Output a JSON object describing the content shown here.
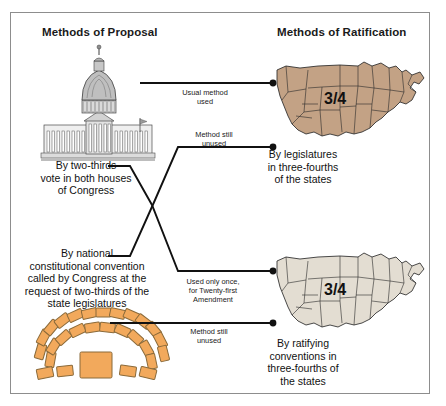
{
  "figure": {
    "titles": {
      "left": "Methods of Proposal",
      "right": "Methods of Ratification"
    },
    "frame_color": "#8d8d8d",
    "background": "#ffffff"
  },
  "proposal_methods": [
    {
      "id": "congress",
      "caption": "By two-thirds\nvote in both houses\nof Congress",
      "illustration": "us-capitol-building-illustration"
    },
    {
      "id": "national-convention",
      "caption": "By national\nconstitutional convention\ncalled by Congress at the\nrequest of two-thirds of the\nstate legislatures",
      "illustration": "convention-desks-arc-illustration"
    }
  ],
  "ratification_methods": [
    {
      "id": "legislatures",
      "caption": "By legislatures\nin three-fourths\nof the states",
      "map_label": "3/4",
      "map_fill": "#c3a285",
      "map_stroke": "#2a2a2a"
    },
    {
      "id": "ratifying-conventions",
      "caption": "By ratifying\nconventions in\nthree-fourths of\nthe states",
      "map_label": "3/4",
      "map_fill": "#e3ddd2",
      "map_stroke": "#2a2a2a"
    }
  ],
  "connections": [
    {
      "id": "usual-method",
      "label": "Usual method\nused",
      "from": "congress",
      "to": "legislatures"
    },
    {
      "id": "unused-top",
      "label": "Method still\nunused",
      "from": "national-convention",
      "to": "legislatures"
    },
    {
      "id": "used-once",
      "label": "Used only once,\nfor Twenty-first\nAmendment",
      "from": "congress",
      "to": "ratifying-conventions"
    },
    {
      "id": "unused-bottom",
      "label": "Method still\nunused",
      "from": "national-convention",
      "to": "ratifying-conventions"
    }
  ],
  "colors": {
    "line": "#111111",
    "desk_fill": "#f2a95c",
    "desk_stroke": "#8a6a3a",
    "capitol_gray": "#5e5e5e"
  }
}
